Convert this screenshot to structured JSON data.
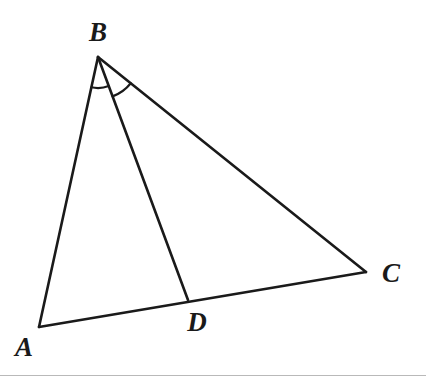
{
  "figure": {
    "canvas": {
      "width": 426,
      "height": 381,
      "background": "#ffffff"
    },
    "style": {
      "stroke_color": "#1a1a1a",
      "stroke_width": 2.6,
      "arc_stroke_width": 2.2,
      "label_color": "#1a1a1a",
      "label_font_size": 27,
      "rule_color": "#b9b9b9"
    },
    "points": [
      {
        "id": "A",
        "label": "A",
        "x": 39,
        "y": 327,
        "label_x": 24,
        "label_y": 347
      },
      {
        "id": "B",
        "label": "B",
        "x": 98,
        "y": 57,
        "label_x": 98,
        "label_y": 32
      },
      {
        "id": "C",
        "label": "C",
        "x": 366,
        "y": 272,
        "label_x": 391,
        "label_y": 273
      },
      {
        "id": "D",
        "label": "D",
        "x": 188,
        "y": 300,
        "label_x": 197,
        "label_y": 322
      }
    ],
    "segments": [
      {
        "id": "AB",
        "from": "A",
        "to": "B",
        "name": "segment-ab"
      },
      {
        "id": "BC",
        "from": "B",
        "to": "C",
        "name": "segment-bc"
      },
      {
        "id": "AC",
        "from": "A",
        "to": "C",
        "name": "segment-ac"
      },
      {
        "id": "BD",
        "from": "B",
        "to": "D",
        "name": "segment-bd-cevian"
      }
    ],
    "angle_marks": [
      {
        "id": "angle-abd",
        "vertex": "B",
        "from": "A",
        "to": "D",
        "radius": 31,
        "path": "M 84.6 84.8 A 31 31 0 0 1 118.2 73.3"
      },
      {
        "id": "angle-dbc",
        "vertex": "B",
        "from": "D",
        "to": "C",
        "radius": 42,
        "path": "M 125.3 89.0 A 42 42 0 0 0 136.6 75.0"
      }
    ],
    "rule": {
      "y": 375,
      "color": "#b9b9b9",
      "height": 1
    }
  }
}
